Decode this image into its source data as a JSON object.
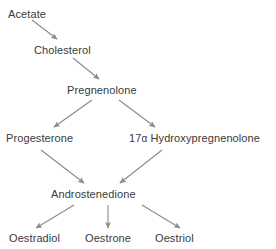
{
  "diagram": {
    "type": "flowchart",
    "background_color": "#ffffff",
    "text_color": "#3a3a3a",
    "arrow_color": "#8a8a8a",
    "nodes": [
      {
        "id": "acetate",
        "label": "Acetate"
      },
      {
        "id": "cholesterol",
        "label": "Cholesterol"
      },
      {
        "id": "pregnenolone",
        "label": "Pregnenolone"
      },
      {
        "id": "progesterone",
        "label": "Progesterone"
      },
      {
        "id": "hydroxypreg",
        "label_prefix": "17",
        "label_alpha": "α",
        "label_suffix": " Hydroxypregnenolone",
        "label": "17α Hydroxypregnenolone"
      },
      {
        "id": "androstenedione",
        "label": "Androstenedione"
      },
      {
        "id": "oestradiol",
        "label": "Oestradiol"
      },
      {
        "id": "oestrone",
        "label": "Oestrone"
      },
      {
        "id": "oestriol",
        "label": "Oestriol"
      }
    ],
    "edges": [
      {
        "from": "acetate",
        "to": "cholesterol"
      },
      {
        "from": "cholesterol",
        "to": "pregnenolone"
      },
      {
        "from": "pregnenolone",
        "to": "progesterone"
      },
      {
        "from": "pregnenolone",
        "to": "hydroxypreg"
      },
      {
        "from": "progesterone",
        "to": "androstenedione"
      },
      {
        "from": "hydroxypreg",
        "to": "androstenedione"
      },
      {
        "from": "androstenedione",
        "to": "oestradiol"
      },
      {
        "from": "androstenedione",
        "to": "oestrone"
      },
      {
        "from": "androstenedione",
        "to": "oestriol"
      }
    ]
  }
}
